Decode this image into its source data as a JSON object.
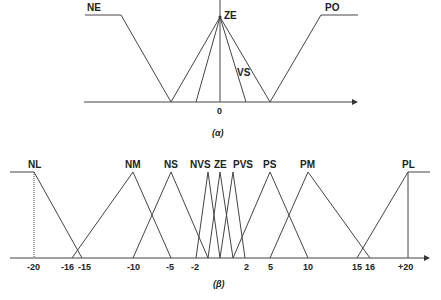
{
  "diagram_a": {
    "caption": "(α)",
    "sets": [
      {
        "name": "NE",
        "label": "NE"
      },
      {
        "name": "ZE",
        "label": "ZE"
      },
      {
        "name": "VS",
        "label": "VS"
      },
      {
        "name": "PO",
        "label": "PO"
      }
    ],
    "tick_labels": [
      "0"
    ]
  },
  "diagram_b": {
    "caption": "(β)",
    "sets": [
      {
        "name": "NL",
        "label": "NL"
      },
      {
        "name": "NM",
        "label": "NM"
      },
      {
        "name": "NS",
        "label": "NS"
      },
      {
        "name": "NVS",
        "label": "NVS"
      },
      {
        "name": "ZE",
        "label": "ZE"
      },
      {
        "name": "PVS",
        "label": "PVS"
      },
      {
        "name": "PS",
        "label": "PS"
      },
      {
        "name": "PM",
        "label": "PM"
      },
      {
        "name": "PL",
        "label": "PL"
      }
    ],
    "tick_labels": [
      "-20",
      "-16",
      "-15",
      "-10",
      "-5",
      "-2",
      "2",
      "5",
      "10",
      "15",
      "16",
      "+20"
    ]
  },
  "colors": {
    "line": "#444444",
    "text": "#222222",
    "background": "#ffffff"
  }
}
